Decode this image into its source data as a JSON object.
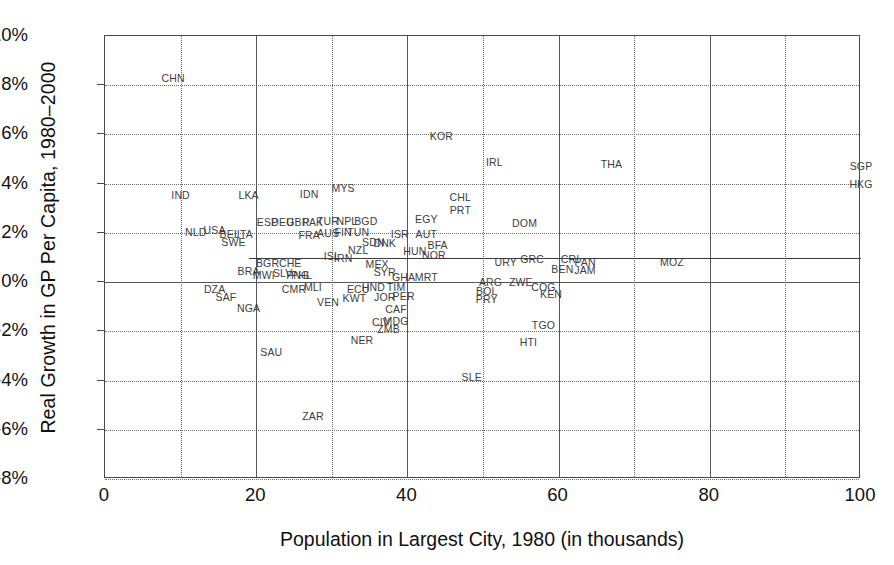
{
  "chart_data": {
    "type": "scatter",
    "title": "",
    "xlabel": "Population in Largest City, 1980 (in thousands)",
    "ylabel": "Real Growth in GP Per Capita, 1980–2000",
    "xlim": [
      0,
      100
    ],
    "ylim": [
      -8,
      10
    ],
    "xticks": [
      "0",
      "20",
      "40",
      "60",
      "80",
      "100"
    ],
    "yticks": [
      "10%",
      "8%",
      "6%",
      "4%",
      "2%",
      "0%",
      "-2%",
      "-4%",
      "-6%",
      "-8%"
    ],
    "grid": "dotted gridlines every 2% on y and every 10 on x; solid major verticals at 20, 40, 60, 80, 100 and solid horizontal at 0%",
    "legend": "none",
    "point_label_style": "three-letter ISO country codes",
    "trendline": {
      "visible": true,
      "x_start": 19,
      "x_end": 100,
      "y_start": 1.0,
      "y_end": 1.0,
      "note": "near-flat regression line at about 1% growth"
    },
    "points": [
      {
        "label": "CHN",
        "x": 9.0,
        "y": 8.3
      },
      {
        "label": "KOR",
        "x": 44.5,
        "y": 5.95
      },
      {
        "label": "IRL",
        "x": 51.5,
        "y": 4.9
      },
      {
        "label": "THA",
        "x": 67.0,
        "y": 4.8
      },
      {
        "label": "SGP",
        "x": 100.0,
        "y": 4.7
      },
      {
        "label": "HKG",
        "x": 100.0,
        "y": 4.0
      },
      {
        "label": "IND",
        "x": 10.0,
        "y": 3.55
      },
      {
        "label": "LKA",
        "x": 19.0,
        "y": 3.55
      },
      {
        "label": "IDN",
        "x": 27.0,
        "y": 3.58
      },
      {
        "label": "MYS",
        "x": 31.5,
        "y": 3.82
      },
      {
        "label": "CHL",
        "x": 47.0,
        "y": 3.45
      },
      {
        "label": "PRT",
        "x": 47.0,
        "y": 2.95
      },
      {
        "label": "EGY",
        "x": 42.5,
        "y": 2.55
      },
      {
        "label": "DOM",
        "x": 55.5,
        "y": 2.42
      },
      {
        "label": "ESP",
        "x": 21.5,
        "y": 2.45
      },
      {
        "label": "DEU",
        "x": 23.5,
        "y": 2.45
      },
      {
        "label": "GBR",
        "x": 25.5,
        "y": 2.45
      },
      {
        "label": "PAK",
        "x": 27.5,
        "y": 2.45
      },
      {
        "label": "TUR",
        "x": 29.5,
        "y": 2.47
      },
      {
        "label": "NPL",
        "x": 32.0,
        "y": 2.48
      },
      {
        "label": "BGD",
        "x": 34.5,
        "y": 2.47
      },
      {
        "label": "NLD",
        "x": 12.0,
        "y": 2.05
      },
      {
        "label": "USA",
        "x": 14.5,
        "y": 2.1
      },
      {
        "label": "BEL",
        "x": 16.5,
        "y": 1.95
      },
      {
        "label": "ITA",
        "x": 18.5,
        "y": 1.95
      },
      {
        "label": "FRA",
        "x": 27.0,
        "y": 1.9
      },
      {
        "label": "AUS",
        "x": 29.5,
        "y": 1.98
      },
      {
        "label": "FIN",
        "x": 31.5,
        "y": 2.05
      },
      {
        "label": "TUN",
        "x": 33.5,
        "y": 2.05
      },
      {
        "label": "ISR",
        "x": 39.0,
        "y": 1.95
      },
      {
        "label": "AUT",
        "x": 42.5,
        "y": 1.95
      },
      {
        "label": "SWE",
        "x": 17.0,
        "y": 1.62
      },
      {
        "label": "SDN",
        "x": 35.5,
        "y": 1.62
      },
      {
        "label": "DNK",
        "x": 37.0,
        "y": 1.58
      },
      {
        "label": "BFA",
        "x": 44.0,
        "y": 1.5
      },
      {
        "label": "NZL",
        "x": 33.5,
        "y": 1.3
      },
      {
        "label": "HUN",
        "x": 41.0,
        "y": 1.25
      },
      {
        "label": "NOR",
        "x": 43.5,
        "y": 1.12
      },
      {
        "label": "ISL",
        "x": 30.0,
        "y": 1.05
      },
      {
        "label": "IRN",
        "x": 31.5,
        "y": 1.0
      },
      {
        "label": "BGR",
        "x": 21.5,
        "y": 0.78
      },
      {
        "label": "CHE",
        "x": 24.5,
        "y": 0.78
      },
      {
        "label": "MEX",
        "x": 36.0,
        "y": 0.72
      },
      {
        "label": "URY",
        "x": 53.0,
        "y": 0.82
      },
      {
        "label": "GRC",
        "x": 56.5,
        "y": 0.95
      },
      {
        "label": "CRI",
        "x": 61.5,
        "y": 0.95
      },
      {
        "label": "PAN",
        "x": 63.5,
        "y": 0.82
      },
      {
        "label": "BRA",
        "x": 19.0,
        "y": 0.45
      },
      {
        "label": "MWI",
        "x": 21.0,
        "y": 0.3
      },
      {
        "label": "SLV",
        "x": 23.5,
        "y": 0.35
      },
      {
        "label": "PNG",
        "x": 25.5,
        "y": 0.3
      },
      {
        "label": "PHL",
        "x": 26.0,
        "y": 0.28
      },
      {
        "label": "SYR",
        "x": 37.0,
        "y": 0.4
      },
      {
        "label": "GHA",
        "x": 39.5,
        "y": 0.22
      },
      {
        "label": "MRT",
        "x": 42.5,
        "y": 0.22
      },
      {
        "label": "BEN",
        "x": 60.5,
        "y": 0.52
      },
      {
        "label": "JAM",
        "x": 63.5,
        "y": 0.48
      },
      {
        "label": "MOZ",
        "x": 75.0,
        "y": 0.8
      },
      {
        "label": "ARG",
        "x": 51.0,
        "y": 0.02
      },
      {
        "label": "ZWE",
        "x": 55.0,
        "y": 0.02
      },
      {
        "label": "COG",
        "x": 58.0,
        "y": -0.18
      },
      {
        "label": "KEN",
        "x": 59.0,
        "y": -0.48
      },
      {
        "label": "DZA",
        "x": 14.5,
        "y": -0.3
      },
      {
        "label": "SAF",
        "x": 16.0,
        "y": -0.62
      },
      {
        "label": "CMR",
        "x": 25.0,
        "y": -0.3
      },
      {
        "label": "MLI",
        "x": 27.5,
        "y": -0.2
      },
      {
        "label": "ECU",
        "x": 33.5,
        "y": -0.28
      },
      {
        "label": "HND",
        "x": 35.5,
        "y": -0.18
      },
      {
        "label": "TIM",
        "x": 38.5,
        "y": -0.18
      },
      {
        "label": "BOL",
        "x": 50.5,
        "y": -0.35
      },
      {
        "label": "PRY",
        "x": 50.5,
        "y": -0.7
      },
      {
        "label": "KWT",
        "x": 33.0,
        "y": -0.65
      },
      {
        "label": "JOR",
        "x": 37.0,
        "y": -0.6
      },
      {
        "label": "PER",
        "x": 39.5,
        "y": -0.58
      },
      {
        "label": "NGA",
        "x": 19.0,
        "y": -1.05
      },
      {
        "label": "VEN",
        "x": 29.5,
        "y": -0.82
      },
      {
        "label": "CAF",
        "x": 38.5,
        "y": -1.08
      },
      {
        "label": "CIV",
        "x": 36.5,
        "y": -1.62
      },
      {
        "label": "MDG",
        "x": 38.5,
        "y": -1.6
      },
      {
        "label": "ZMB",
        "x": 37.5,
        "y": -1.9
      },
      {
        "label": "TGO",
        "x": 58.0,
        "y": -1.75
      },
      {
        "label": "NER",
        "x": 34.0,
        "y": -2.35
      },
      {
        "label": "HTI",
        "x": 56.0,
        "y": -2.45
      },
      {
        "label": "SAU",
        "x": 22.0,
        "y": -2.85
      },
      {
        "label": "SLE",
        "x": 48.5,
        "y": -3.85
      },
      {
        "label": "ZAR",
        "x": 27.5,
        "y": -5.45
      }
    ]
  }
}
